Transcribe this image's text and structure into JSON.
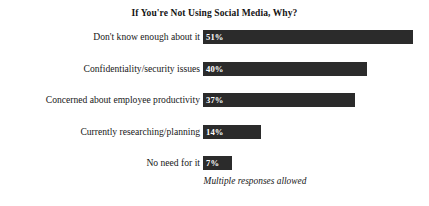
{
  "chart_data": {
    "type": "bar",
    "orientation": "horizontal",
    "title": "If You're Not Using Social Media, Why?",
    "xlabel": "",
    "ylabel": "",
    "xlim": [
      0,
      55
    ],
    "grid": false,
    "legend": null,
    "annotation": "Multiple responses allowed",
    "value_suffix": "%",
    "bar_color": "#2b2b2b",
    "value_label_color": "#ffffff",
    "background_color": "#ffffff",
    "categories": [
      "Don't know enough about it",
      "Confidentiality/security issues",
      "Concerned about employee productivity",
      "Currently researching/planning",
      "No need for it"
    ],
    "values": [
      51,
      40,
      37,
      14,
      7
    ],
    "data_labels": [
      "51%",
      "40%",
      "37%",
      "14%",
      "7%"
    ],
    "points": [
      {
        "category": "Don't know enough about it",
        "value": 51,
        "label": "51%"
      },
      {
        "category": "Confidentiality/security issues",
        "value": 40,
        "label": "40%"
      },
      {
        "category": "Concerned about employee productivity",
        "value": 37,
        "label": "37%"
      },
      {
        "category": "Currently researching/planning",
        "value": 14,
        "label": "14%"
      },
      {
        "category": "No need for it",
        "value": 7,
        "label": "7%"
      }
    ]
  }
}
